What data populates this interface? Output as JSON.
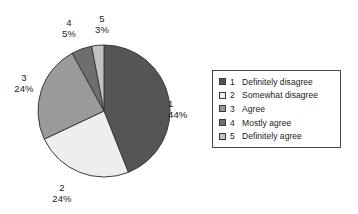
{
  "chart_data": {
    "type": "pie",
    "title": "",
    "subtitle": "",
    "xlabel": "",
    "ylabel": "",
    "legend_position": "right",
    "grid": false,
    "start_angle_deg": 0,
    "direction": "clockwise",
    "categories": [
      "1 Definitely disagree",
      "2 Somewhat disagree",
      "3 Agree",
      "4 Mostly agree",
      "5 Definitely agree"
    ],
    "values": [
      44,
      24,
      24,
      5,
      3
    ],
    "unit": "%",
    "slices": [
      {
        "key": "1",
        "label": "Definitely disagree",
        "value": 44,
        "percent_text": "44%",
        "color": "#555555"
      },
      {
        "key": "2",
        "label": "Somewhat disagree",
        "value": 24,
        "percent_text": "24%",
        "color": "#eeeeee"
      },
      {
        "key": "3",
        "label": "Agree",
        "value": 24,
        "percent_text": "24%",
        "color": "#9a9a9a"
      },
      {
        "key": "4",
        "label": "Mostly agree",
        "value": 5,
        "percent_text": "5%",
        "color": "#6e6e6e"
      },
      {
        "key": "5",
        "label": "Definitely agree",
        "value": 3,
        "percent_text": "3%",
        "color": "#c2c2c2"
      }
    ]
  },
  "labels": {
    "s1": {
      "key": "1",
      "pct": "44%"
    },
    "s2": {
      "key": "2",
      "pct": "24%"
    },
    "s3": {
      "key": "3",
      "pct": "24%"
    },
    "s4": {
      "key": "4",
      "pct": "5%"
    },
    "s5": {
      "key": "5",
      "pct": "3%"
    }
  },
  "legend": {
    "items": [
      {
        "key": "1",
        "label": "Definitely disagree",
        "color": "#555555"
      },
      {
        "key": "2",
        "label": "Somewhat disagree",
        "color": "#eeeeee"
      },
      {
        "key": "3",
        "label": "Agree",
        "color": "#9a9a9a"
      },
      {
        "key": "4",
        "label": "Mostly agree",
        "color": "#6e6e6e"
      },
      {
        "key": "5",
        "label": "Definitely agree",
        "color": "#c2c2c2"
      }
    ]
  },
  "colors": {
    "outline": "#3a3a3a",
    "legend_border": "#4a4a4a",
    "text": "#1a1a1a",
    "background": "#ffffff"
  }
}
